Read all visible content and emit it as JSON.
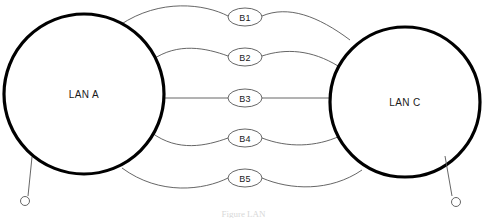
{
  "diagram": {
    "type": "network-topology",
    "title_caption": "Figure  LAN",
    "background_color": "#ffffff",
    "node_stroke_color": "#000000",
    "link_stroke_color": "#555555",
    "nodes": [
      {
        "id": "lan-a",
        "label": "LAN A",
        "cx": 84,
        "cy": 94,
        "r": 80,
        "stroke_width": 3.2,
        "stub": {
          "from_x": 32,
          "from_y": 157,
          "to_x": 28,
          "to_y": 196,
          "endpoint_cx": 25,
          "endpoint_cy": 201,
          "endpoint_r": 4.5
        }
      },
      {
        "id": "lan-c",
        "label": "LAN C",
        "cx": 405,
        "cy": 102,
        "r": 75,
        "stroke_width": 3.2,
        "stub": {
          "from_x": 445,
          "from_y": 156,
          "to_x": 452,
          "to_y": 196,
          "endpoint_cx": 456,
          "endpoint_cy": 202,
          "endpoint_r": 4.5
        }
      }
    ],
    "links": [
      {
        "id": "b1",
        "label": "B1",
        "label_cx": 245,
        "label_cy": 17,
        "label_rx": 17,
        "label_ry": 9,
        "path": "M 120,25 C 160,-2 205,4 228,16",
        "path_right": "M 262,16 C 288,5 318,16 350,40"
      },
      {
        "id": "b2",
        "label": "B2",
        "label_cx": 245,
        "label_cy": 57,
        "label_rx": 17,
        "label_ry": 9,
        "path": "M 152,60 C 178,42 206,48 228,56",
        "path_right": "M 262,56 C 286,48 312,50 338,66"
      },
      {
        "id": "b3",
        "label": "B3",
        "label_cx": 245,
        "label_cy": 98,
        "label_rx": 17,
        "label_ry": 9,
        "path": "M 163,98 L 228,98",
        "path_right": "M 262,98 L 331,98"
      },
      {
        "id": "b4",
        "label": "B4",
        "label_cx": 245,
        "label_cy": 138,
        "label_rx": 17,
        "label_ry": 9,
        "path": "M 152,133 C 178,152 206,146 228,138",
        "path_right": "M 262,138 C 288,148 316,147 340,136"
      },
      {
        "id": "b5",
        "label": "B5",
        "label_cx": 245,
        "label_cy": 178,
        "label_rx": 17,
        "label_ry": 9,
        "path": "M 122,168 C 160,196 204,190 228,178",
        "path_right": "M 262,178 C 290,190 330,192 362,170"
      }
    ]
  }
}
